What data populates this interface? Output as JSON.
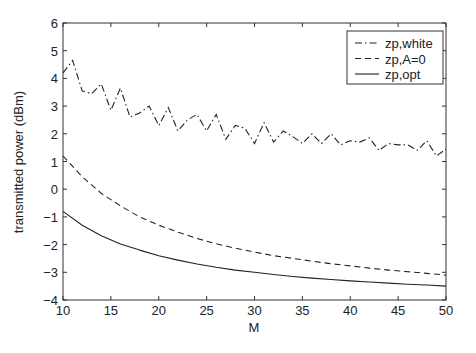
{
  "chart_data": {
    "type": "line",
    "title": "",
    "xlabel": "M",
    "ylabel": "transmitted power (dBm)",
    "xlim": [
      10,
      50
    ],
    "ylim": [
      -4,
      6
    ],
    "xticks": [
      10,
      15,
      20,
      25,
      30,
      35,
      40,
      45,
      50
    ],
    "yticks": [
      -4,
      -3,
      -2,
      -1,
      0,
      1,
      2,
      3,
      4,
      5,
      6
    ],
    "grid": false,
    "legend_position": "upper right",
    "series": [
      {
        "name": "zp,white",
        "style": "dash-dot",
        "x": [
          10,
          11,
          12,
          13,
          14,
          15,
          16,
          17,
          18,
          19,
          20,
          21,
          22,
          23,
          24,
          25,
          26,
          27,
          28,
          29,
          30,
          31,
          32,
          33,
          34,
          35,
          36,
          37,
          38,
          39,
          40,
          41,
          42,
          43,
          44,
          45,
          46,
          47,
          48,
          49,
          50
        ],
        "values": [
          4.2,
          4.65,
          3.55,
          3.45,
          3.8,
          2.85,
          3.65,
          2.6,
          2.75,
          3.0,
          2.3,
          2.95,
          2.1,
          2.5,
          2.7,
          2.1,
          2.7,
          1.8,
          2.3,
          2.2,
          1.65,
          2.4,
          1.7,
          2.1,
          1.9,
          1.65,
          2.0,
          1.65,
          2.0,
          1.6,
          1.75,
          1.7,
          1.85,
          1.4,
          1.65,
          1.6,
          1.6,
          1.4,
          1.75,
          1.2,
          1.45
        ]
      },
      {
        "name": "zp,A=0",
        "style": "dashed",
        "x": [
          10,
          12,
          14,
          16,
          18,
          20,
          22,
          24,
          26,
          28,
          30,
          32,
          34,
          36,
          38,
          40,
          42,
          44,
          46,
          48,
          50
        ],
        "values": [
          1.2,
          0.45,
          -0.15,
          -0.6,
          -1.0,
          -1.3,
          -1.55,
          -1.78,
          -1.97,
          -2.13,
          -2.27,
          -2.4,
          -2.5,
          -2.6,
          -2.69,
          -2.77,
          -2.85,
          -2.92,
          -2.98,
          -3.04,
          -3.1
        ]
      },
      {
        "name": "zp,opt",
        "style": "solid",
        "x": [
          10,
          12,
          14,
          16,
          18,
          20,
          22,
          24,
          26,
          28,
          30,
          32,
          34,
          36,
          38,
          40,
          42,
          44,
          46,
          48,
          50
        ],
        "values": [
          -0.8,
          -1.3,
          -1.68,
          -1.98,
          -2.2,
          -2.4,
          -2.56,
          -2.7,
          -2.82,
          -2.92,
          -3.0,
          -3.08,
          -3.15,
          -3.21,
          -3.26,
          -3.31,
          -3.35,
          -3.39,
          -3.43,
          -3.46,
          -3.5
        ]
      }
    ]
  }
}
